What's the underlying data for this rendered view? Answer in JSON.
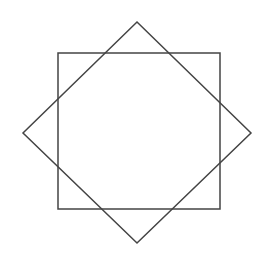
{
  "diagram": {
    "stroke_color": "#444444",
    "stroke_width": 1.5,
    "background": "#ffffff",
    "shapes": [
      {
        "name": "axis-aligned-square",
        "points": [
          [
            58,
            53
          ],
          [
            220,
            53
          ],
          [
            220,
            209
          ],
          [
            58,
            209
          ]
        ]
      },
      {
        "name": "rotated-square",
        "points": [
          [
            137,
            22
          ],
          [
            251,
            133
          ],
          [
            137,
            243
          ],
          [
            23,
            133
          ]
        ]
      }
    ]
  }
}
